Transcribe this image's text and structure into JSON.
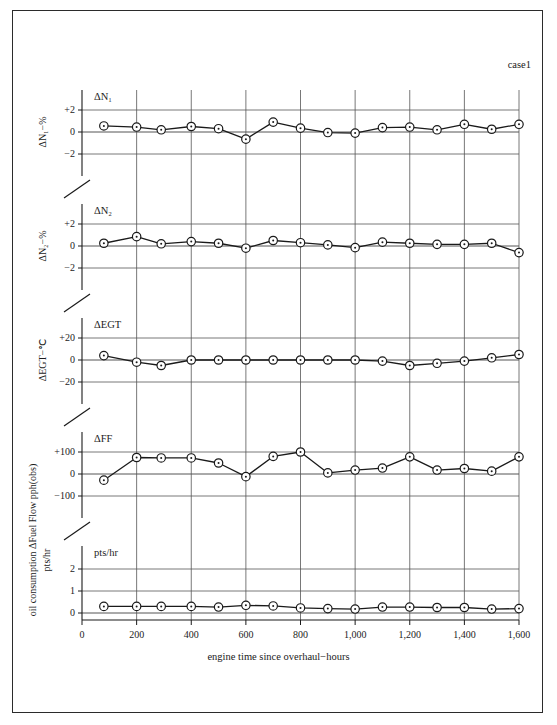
{
  "figure": {
    "case_label": "case1",
    "x_axis_title": "engine time since overhaul−hours",
    "background_color": "#ffffff",
    "line_color": "#1a1a1a",
    "grid_color": "#555555",
    "border_color": "#2b2b2b"
  },
  "chart_data": [
    {
      "type": "line",
      "title": "ΔN₁",
      "panel_index": 0,
      "ylabel": "ΔN₁−%",
      "xlabel": "engine time since overhaul−hours",
      "ylim": [
        -3,
        3
      ],
      "yticks": [
        2,
        0,
        -2
      ],
      "ytick_labels": [
        "+2",
        "0",
        "−2"
      ],
      "xlim": [
        0,
        1600
      ],
      "xticks": [
        0,
        200,
        400,
        600,
        800,
        1000,
        1200,
        1400,
        1600
      ],
      "xtick_labels": [
        "0",
        "200",
        "400",
        "600",
        "800",
        "1,000",
        "1,200",
        "1,400",
        "1,600"
      ],
      "grid": true,
      "legend": "none",
      "x": [
        80,
        200,
        290,
        400,
        500,
        600,
        700,
        800,
        900,
        1000,
        1100,
        1200,
        1300,
        1400,
        1500,
        1600
      ],
      "values": [
        0.55,
        0.45,
        0.2,
        0.5,
        0.3,
        -0.65,
        0.9,
        0.35,
        -0.05,
        -0.1,
        0.4,
        0.45,
        0.2,
        0.7,
        0.25,
        0.7
      ]
    },
    {
      "type": "line",
      "title": "ΔN₂",
      "panel_index": 1,
      "ylabel": "ΔN₂−%",
      "xlabel": "engine time since overhaul−hours",
      "ylim": [
        -3,
        3
      ],
      "yticks": [
        2,
        0,
        -2
      ],
      "ytick_labels": [
        "+2",
        "0",
        "−2"
      ],
      "xlim": [
        0,
        1600
      ],
      "xticks": [
        0,
        200,
        400,
        600,
        800,
        1000,
        1200,
        1400,
        1600
      ],
      "xtick_labels": [
        "0",
        "200",
        "400",
        "600",
        "800",
        "1,000",
        "1,200",
        "1,400",
        "1,600"
      ],
      "grid": true,
      "legend": "none",
      "x": [
        80,
        200,
        290,
        400,
        500,
        600,
        700,
        800,
        900,
        1000,
        1100,
        1200,
        1300,
        1400,
        1500,
        1600
      ],
      "values": [
        0.25,
        0.85,
        0.2,
        0.4,
        0.25,
        -0.2,
        0.5,
        0.3,
        0.1,
        -0.15,
        0.35,
        0.25,
        0.15,
        0.15,
        0.25,
        -0.6
      ]
    },
    {
      "type": "line",
      "title": "ΔEGT",
      "panel_index": 2,
      "ylabel": "ΔEGT−℃",
      "xlabel": "engine time since overhaul−hours",
      "ylim": [
        -30,
        30
      ],
      "yticks": [
        20,
        0,
        -20
      ],
      "ytick_labels": [
        "+20",
        "0",
        "−20"
      ],
      "xlim": [
        0,
        1600
      ],
      "xticks": [
        0,
        200,
        400,
        600,
        800,
        1000,
        1200,
        1400,
        1600
      ],
      "xtick_labels": [
        "0",
        "200",
        "400",
        "600",
        "800",
        "1,000",
        "1,200",
        "1,400",
        "1,600"
      ],
      "grid": true,
      "legend": "none",
      "x": [
        80,
        200,
        290,
        400,
        500,
        600,
        700,
        800,
        900,
        1000,
        1100,
        1200,
        1300,
        1400,
        1500,
        1600
      ],
      "values": [
        4,
        -2,
        -5,
        0,
        0,
        0,
        0,
        0,
        0,
        0,
        -1,
        -5,
        -3,
        -1,
        2,
        5
      ]
    },
    {
      "type": "line",
      "title": "ΔFF",
      "panel_index": 3,
      "ylabel": "oil consumption ΔFuel Flow pph(obs)",
      "xlabel": "engine time since overhaul−hours",
      "ylim": [
        -150,
        150
      ],
      "yticks": [
        100,
        0,
        -100
      ],
      "ytick_labels": [
        "+100",
        "0",
        "−100"
      ],
      "xlim": [
        0,
        1600
      ],
      "xticks": [
        0,
        200,
        400,
        600,
        800,
        1000,
        1200,
        1400,
        1600
      ],
      "xtick_labels": [
        "0",
        "200",
        "400",
        "600",
        "800",
        "1,000",
        "1,200",
        "1,400",
        "1,600"
      ],
      "grid": true,
      "legend": "none",
      "x": [
        80,
        200,
        290,
        400,
        500,
        600,
        700,
        800,
        900,
        1000,
        1100,
        1200,
        1300,
        1400,
        1500,
        1600
      ],
      "values": [
        -28,
        75,
        73,
        73,
        50,
        -12,
        80,
        100,
        5,
        18,
        27,
        78,
        18,
        25,
        13,
        78
      ]
    },
    {
      "type": "line",
      "title": "pts/hr",
      "panel_index": 4,
      "ylabel": "pts/hr",
      "xlabel": "engine time since overhaul−hours",
      "ylim": [
        0,
        2.6
      ],
      "yticks": [
        2,
        1,
        0
      ],
      "ytick_labels": [
        "2",
        "1",
        "0"
      ],
      "xlim": [
        0,
        1600
      ],
      "xticks": [
        0,
        200,
        400,
        600,
        800,
        1000,
        1200,
        1400,
        1600
      ],
      "xtick_labels": [
        "0",
        "200",
        "400",
        "600",
        "800",
        "1,000",
        "1,200",
        "1,400",
        "1,600"
      ],
      "grid": true,
      "legend": "none",
      "x": [
        80,
        200,
        290,
        400,
        500,
        600,
        700,
        800,
        900,
        1000,
        1100,
        1200,
        1300,
        1400,
        1500,
        1600
      ],
      "values": [
        0.3,
        0.3,
        0.3,
        0.3,
        0.27,
        0.35,
        0.32,
        0.23,
        0.2,
        0.18,
        0.27,
        0.27,
        0.25,
        0.25,
        0.18,
        0.2
      ]
    }
  ],
  "axis_labels": {
    "panel0_y": "ΔN₁−%",
    "panel1_y": "ΔN₂−%",
    "panel2_y": "ΔEGT−℃",
    "panel3_y": "oil consumption ΔFuel Flow pph(obs)",
    "panel4_y": "pts/hr"
  }
}
